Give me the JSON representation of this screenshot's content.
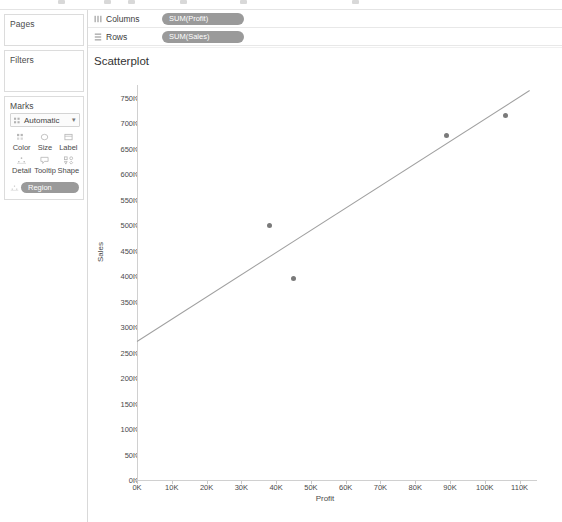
{
  "toolbar": {
    "icon_count": 6
  },
  "left_panel": {
    "pages": {
      "title": "Pages"
    },
    "filters": {
      "title": "Filters"
    },
    "marks": {
      "title": "Marks",
      "type_label": "Automatic",
      "type_icon": "mark-type-icon",
      "caret": "▾",
      "buttons": [
        {
          "label": "Color",
          "icon": "color-icon"
        },
        {
          "label": "Size",
          "icon": "size-icon"
        },
        {
          "label": "Label",
          "icon": "label-icon"
        },
        {
          "label": "Detail",
          "icon": "detail-icon"
        },
        {
          "label": "Tooltip",
          "icon": "tooltip-icon"
        },
        {
          "label": "Shape",
          "icon": "shape-icon"
        }
      ],
      "region_pill": "Region",
      "region_icon": "detail-icon"
    }
  },
  "shelves": [
    {
      "name": "columns",
      "label": "Columns",
      "icon": "columns-icon",
      "pill": "SUM(Profit)"
    },
    {
      "name": "rows",
      "label": "Rows",
      "icon": "rows-icon",
      "pill": "SUM(Sales)"
    }
  ],
  "chart_data": {
    "type": "scatter",
    "title": "Scatterplot",
    "xlabel": "Profit",
    "ylabel": "Sales",
    "xlim": [
      0,
      115000
    ],
    "ylim": [
      0,
      775000
    ],
    "xticks": [
      0,
      10000,
      20000,
      30000,
      40000,
      50000,
      60000,
      70000,
      80000,
      90000,
      100000,
      110000
    ],
    "xticklabels": [
      "0K",
      "10K",
      "20K",
      "30K",
      "40K",
      "50K",
      "60K",
      "70K",
      "80K",
      "90K",
      "100K",
      "110K"
    ],
    "yticks": [
      0,
      50000,
      100000,
      150000,
      200000,
      250000,
      300000,
      350000,
      400000,
      450000,
      500000,
      550000,
      600000,
      650000,
      700000,
      750000
    ],
    "yticklabels": [
      "0K",
      "50K",
      "100K",
      "150K",
      "200K",
      "250K",
      "300K",
      "350K",
      "400K",
      "450K",
      "500K",
      "550K",
      "600K",
      "650K",
      "700K",
      "750K"
    ],
    "grid": false,
    "legend": null,
    "marker_color": "#7a7a7a",
    "points": [
      {
        "x": 38000,
        "y": 500000
      },
      {
        "x": 45000,
        "y": 395000
      },
      {
        "x": 89000,
        "y": 675000
      },
      {
        "x": 106000,
        "y": 715000
      }
    ],
    "trendline": {
      "type": "linear",
      "color": "#a0a0a0",
      "x_start": 0,
      "y_start": 272000,
      "x_end": 113000,
      "y_end": 765000
    }
  },
  "colors": {
    "pill": "#9a9a9a",
    "marker": "#7a7a7a",
    "trend": "#a0a0a0",
    "axis": "#d0d0d0",
    "text": "#4a4a4a"
  }
}
